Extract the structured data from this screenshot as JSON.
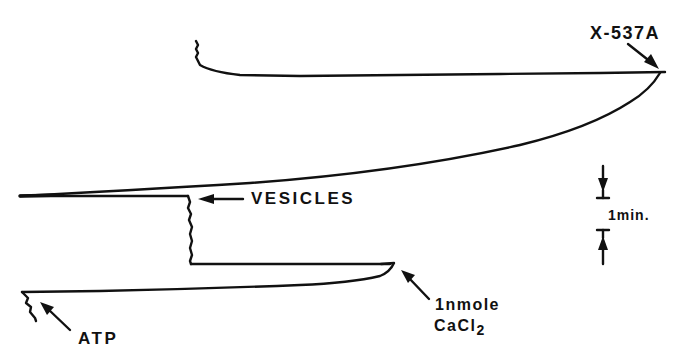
{
  "figure": {
    "type": "chart-recorder trace diagram",
    "colors": {
      "ink": "#111111",
      "background": "#ffffff"
    },
    "annotations": {
      "x537a": "X-537A",
      "vesicles": "VESICLES",
      "atp": "ATP",
      "calcium_amount": "1nmole",
      "calcium_compound": "CaCl",
      "calcium_subscript": "2",
      "time_scale": "1min."
    },
    "traces": [
      {
        "name": "atp-addition",
        "description": "jagged deflection at start of bottom trace"
      },
      {
        "name": "baseline-after-atp",
        "description": "flat trace rising slightly to the right"
      },
      {
        "name": "cacl2-addition",
        "description": "hook at right end of lower trace"
      },
      {
        "name": "vesicles-addition",
        "description": "jagged vertical step"
      },
      {
        "name": "uptake-curve",
        "description": "long sweeping curve"
      },
      {
        "name": "x537a-release",
        "description": "return to top baseline"
      }
    ],
    "scale_bar": {
      "label": "1min.",
      "orientation": "vertical"
    }
  }
}
